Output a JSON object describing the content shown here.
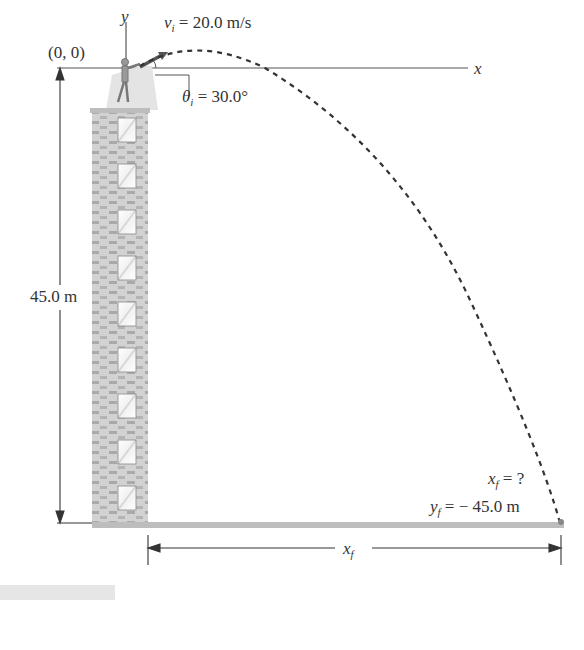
{
  "figure": {
    "origin_label": "(0, 0)",
    "x_axis_label": "x",
    "y_axis_label": "y",
    "initial_velocity": {
      "symbol": "v",
      "subscript": "i",
      "value": "= 20.0 m/s"
    },
    "launch_angle": {
      "symbol": "θ",
      "subscript": "i",
      "value": "= 30.0°"
    },
    "height_label": "45.0 m",
    "final_x": {
      "symbol": "x",
      "subscript": "f",
      "value": "= ?"
    },
    "final_y": {
      "symbol": "y",
      "subscript": "f",
      "value": "= − 45.0 m"
    },
    "range_label": {
      "symbol": "x",
      "subscript": "f"
    },
    "building": {
      "window_count": 9
    },
    "colors": {
      "line": "#444444",
      "trajectory": "#333333",
      "brick": "#c8c8c8",
      "ground": "#bdbdbd"
    }
  }
}
